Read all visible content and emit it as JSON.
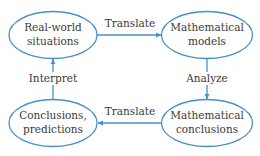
{
  "colors": {
    "stroke": "#4a8fc9",
    "background": "#ffffff",
    "text": "#3a3a3a"
  },
  "nodes": [
    {
      "id": "real_world",
      "line1": "Real-world",
      "line2": "situations"
    },
    {
      "id": "math_models",
      "line1": "Mathematical",
      "line2": "models"
    },
    {
      "id": "math_conclusions",
      "line1": "Mathematical",
      "line2": "conclusions"
    },
    {
      "id": "conclusions_predictions",
      "line1": "Conclusions,",
      "line2": "predictions"
    }
  ],
  "edges": [
    {
      "from": "real_world",
      "to": "math_models",
      "label": "Translate"
    },
    {
      "from": "math_models",
      "to": "math_conclusions",
      "label": "Analyze"
    },
    {
      "from": "math_conclusions",
      "to": "conclusions_predictions",
      "label": "Translate"
    },
    {
      "from": "conclusions_predictions",
      "to": "real_world",
      "label": "Interpret"
    }
  ]
}
